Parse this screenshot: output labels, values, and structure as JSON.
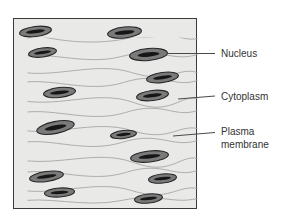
{
  "diagram": {
    "labels": [
      {
        "id": "nucleus",
        "text": "Nucleus"
      },
      {
        "id": "cytoplasm",
        "text": "Cytoplasm"
      },
      {
        "id": "plasma-membrane",
        "text": "Plasma membrane"
      }
    ]
  },
  "colors": {
    "background": "#ffffff",
    "tissue_fill": "#e9e9e7",
    "box_border": "#3a3a3a",
    "cell_line": "#9e9e9c",
    "nucleus_fill": "#7a7a7a",
    "nucleus_outline": "#262626",
    "nucleus_core": "#161616",
    "leader_line": "#4a4a4a",
    "label_text": "#333333"
  }
}
